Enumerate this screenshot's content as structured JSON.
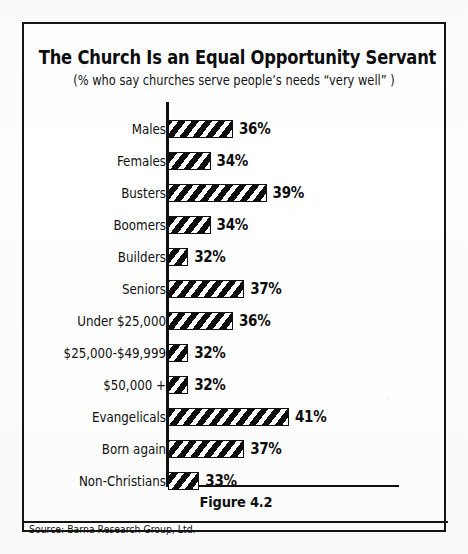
{
  "figure": {
    "caption": "Figure 4.2",
    "source": "Source: Barna Research Group, Ltd."
  },
  "chart_data": {
    "type": "bar",
    "orientation": "horizontal",
    "title": "The Church Is an Equal Opportunity Servant",
    "subtitle": "(% who say churches serve people’s needs “very well” )",
    "xlabel": "",
    "ylabel": "",
    "value_suffix": "%",
    "xlim": [
      30,
      42
    ],
    "grid": false,
    "legend": null,
    "categories": [
      "Males",
      "Females",
      "Busters",
      "Boomers",
      "Builders",
      "Seniors",
      "Under $25,000",
      "$25,000-$49,999",
      "$50,000 +",
      "Evangelicals",
      "Born again",
      "Non-Christians"
    ],
    "values": [
      36,
      34,
      39,
      34,
      32,
      37,
      36,
      32,
      32,
      41,
      37,
      33
    ],
    "value_labels": [
      "36%",
      "34%",
      "39%",
      "34%",
      "32%",
      "37%",
      "36%",
      "32%",
      "32%",
      "41%",
      "37%",
      "33%"
    ]
  },
  "style": {
    "ink": "#101010",
    "paper": "#ffffff",
    "bar_fill": "#101010",
    "bar_hatch": "#ffffff"
  }
}
